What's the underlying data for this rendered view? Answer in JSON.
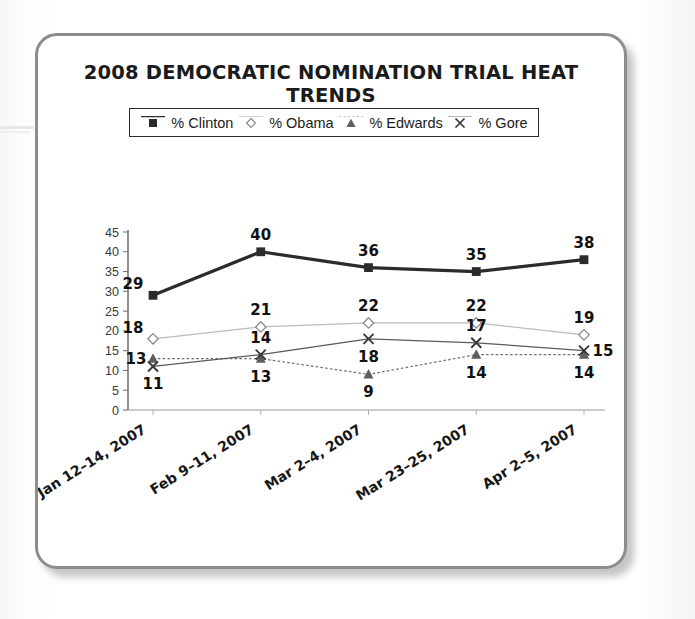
{
  "figure": {
    "title": "2008 DEMOCRATIC NOMINATION TRIAL HEAT TRENDS",
    "border_color": "#8d8d8d",
    "background": "#ffffff"
  },
  "legend": {
    "position": "top-center",
    "items": [
      {
        "label": "% Clinton",
        "marker": "filled-square-icon",
        "color": "#2b2b2b"
      },
      {
        "label": "% Obama",
        "marker": "open-diamond-icon",
        "color": "#b9b9b9"
      },
      {
        "label": "% Edwards",
        "marker": "filled-triangle-icon",
        "color": "#6e6e6e"
      },
      {
        "label": "% Gore",
        "marker": "x-cross-icon",
        "color": "#5a5a5a"
      }
    ]
  },
  "chart_data": {
    "type": "line",
    "title": "2008 DEMOCRATIC NOMINATION TRIAL HEAT TRENDS",
    "xlabel": "",
    "ylabel": "",
    "ylim": [
      0,
      45
    ],
    "yticks": [
      0,
      5,
      10,
      15,
      20,
      25,
      30,
      35,
      40,
      45
    ],
    "grid": false,
    "legend_position": "top-center",
    "categories": [
      "Jan 12–14, 2007",
      "Feb 9–11, 2007",
      "Mar 2–4, 2007",
      "Mar 23–25, 2007",
      "Apr 2–5, 2007"
    ],
    "series": [
      {
        "name": "% Clinton",
        "color": "#2b2b2b",
        "marker": "filled-square-icon",
        "linewidth": "thick",
        "values": [
          29,
          40,
          36,
          35,
          38
        ],
        "label_positions": [
          "above-left",
          "above",
          "above",
          "above",
          "above"
        ]
      },
      {
        "name": "% Obama",
        "color": "#bcbcbc",
        "marker": "open-diamond-icon",
        "linewidth": "thin",
        "values": [
          18,
          21,
          22,
          22,
          19
        ],
        "label_positions": [
          "above-left",
          "above",
          "above",
          "above",
          "above"
        ]
      },
      {
        "name": "% Edwards",
        "color": "#6e6e6e",
        "marker": "filled-triangle-icon",
        "linewidth": "thin-dotted",
        "values": [
          13,
          13,
          9,
          14,
          14
        ],
        "label_positions": [
          "left",
          "below",
          "below",
          "below",
          "below"
        ]
      },
      {
        "name": "% Gore",
        "color": "#5a5a5a",
        "marker": "x-cross-icon",
        "linewidth": "thin",
        "values": [
          11,
          14,
          18,
          17,
          15
        ],
        "label_positions": [
          "below",
          "above",
          "below",
          "above",
          "right"
        ]
      }
    ]
  }
}
